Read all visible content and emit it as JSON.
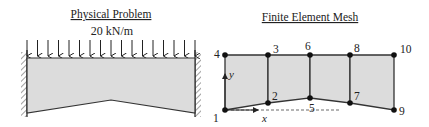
{
  "physical_problem": {
    "title": "Physical Problem",
    "load_label": "20 kN/m",
    "load_arrow_count": 17,
    "supports": [
      "fixed-left",
      "fixed-right"
    ]
  },
  "mesh": {
    "title": "Finite Element Mesh",
    "axis_labels": {
      "x": "x",
      "y": "y"
    },
    "nodes": [
      {
        "id": "1",
        "label": "1"
      },
      {
        "id": "2",
        "label": "2"
      },
      {
        "id": "3",
        "label": "3"
      },
      {
        "id": "4",
        "label": "4"
      },
      {
        "id": "5",
        "label": "5"
      },
      {
        "id": "6",
        "label": "6"
      },
      {
        "id": "7",
        "label": "7"
      },
      {
        "id": "8",
        "label": "8"
      },
      {
        "id": "9",
        "label": "9"
      },
      {
        "id": "10",
        "label": "10"
      }
    ],
    "elements": [
      [
        "1",
        "2",
        "3",
        "4"
      ],
      [
        "2",
        "5",
        "6",
        "3"
      ],
      [
        "5",
        "7",
        "8",
        "6"
      ],
      [
        "7",
        "9",
        "10",
        "8"
      ]
    ]
  },
  "colors": {
    "fill": "#dcdcdc",
    "stroke": "#333333",
    "text": "#222222"
  }
}
